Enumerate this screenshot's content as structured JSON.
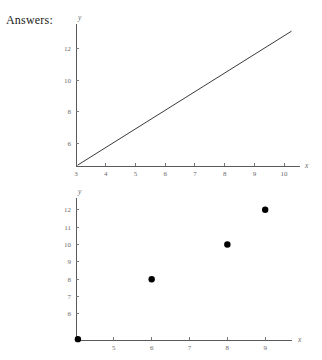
{
  "page": {
    "heading": "Answers:",
    "background_color": "#ffffff",
    "text_color": "#1a1a1a"
  },
  "chart_data": [
    {
      "id": "line-chart",
      "type": "line",
      "title": "",
      "xlabel": "x",
      "ylabel": "y",
      "xlim": [
        3,
        10.4
      ],
      "ylim": [
        4.55,
        13.3
      ],
      "grid": false,
      "legend": null,
      "x_ticks": [
        4,
        5,
        6,
        7,
        8,
        9,
        10
      ],
      "x_tick_labels": [
        "4",
        "5",
        "6",
        "7",
        "8",
        "9",
        "10"
      ],
      "y_ticks": [
        6,
        8,
        10,
        12
      ],
      "y_tick_labels": [
        "6",
        "8",
        "10",
        "12"
      ],
      "origin_label": "3",
      "series": [
        {
          "name": "line",
          "color": "#3a3a3a",
          "x": [
            3.05,
            10.25
          ],
          "y": [
            4.6,
            13.1
          ]
        }
      ]
    },
    {
      "id": "scatter-chart",
      "type": "scatter",
      "title": "",
      "xlabel": "x",
      "ylabel": "y",
      "xlim": [
        4,
        9.55
      ],
      "ylim": [
        4.5,
        12.45
      ],
      "grid": false,
      "legend": null,
      "x_ticks": [
        5,
        6,
        7,
        8,
        9
      ],
      "x_tick_labels": [
        "5",
        "6",
        "7",
        "8",
        "9"
      ],
      "y_ticks": [
        6,
        7,
        8,
        9,
        10,
        11,
        12
      ],
      "y_tick_labels": [
        "6",
        "7",
        "8",
        "9",
        "10",
        "11",
        "12"
      ],
      "series": [
        {
          "name": "points",
          "color": "#000000",
          "marker": "circle",
          "points": [
            {
              "x": 4.05,
              "y": 4.55
            },
            {
              "x": 6,
              "y": 8
            },
            {
              "x": 8,
              "y": 10
            },
            {
              "x": 9,
              "y": 12
            }
          ]
        }
      ]
    }
  ]
}
